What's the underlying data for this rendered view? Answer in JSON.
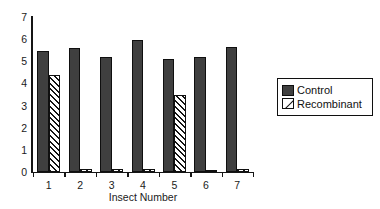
{
  "chart_data": {
    "type": "bar",
    "title": "",
    "subtitle": "",
    "xlabel": "Insect Number",
    "ylabel": "",
    "categories": [
      "1",
      "2",
      "3",
      "4",
      "5",
      "6",
      "7"
    ],
    "series": [
      {
        "name": "Control",
        "color": "#3f3f3f",
        "fill": "solid",
        "values": [
          5.45,
          5.6,
          5.2,
          5.95,
          5.1,
          5.2,
          5.65
        ]
      },
      {
        "name": "Recombinant",
        "color": "#ffffff",
        "fill": "diagonal-hatch",
        "values": [
          4.4,
          0.15,
          0.15,
          0.12,
          3.5,
          0.1,
          0.12
        ]
      }
    ],
    "ylim": [
      0,
      7
    ],
    "ytick_labels": [
      "0",
      "1",
      "2",
      "3",
      "4",
      "5",
      "6",
      "7"
    ],
    "ytick_values": [
      0,
      1,
      2,
      3,
      4,
      5,
      6,
      7
    ],
    "xtick_labels": [
      "1",
      "2",
      "3",
      "4",
      "5",
      "6",
      "7"
    ],
    "grid": false,
    "legend_position": "right"
  },
  "legend": {
    "entries": [
      {
        "label": "Control"
      },
      {
        "label": "Recombinant"
      }
    ]
  },
  "axes": {
    "x_title": "Insect Number"
  },
  "colors": {
    "control": "#3f3f3f",
    "recombinant": "#ffffff",
    "axis": "#151515",
    "background": "#ffffff"
  }
}
